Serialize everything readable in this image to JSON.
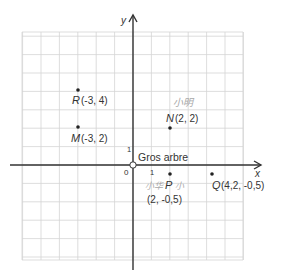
{
  "header": {
    "cut_off_text": ""
  },
  "diagram": {
    "type": "coordinate-plane",
    "origin_px": [
      133,
      165
    ],
    "unit_px": 18.4,
    "grid": {
      "x_min_px": 22,
      "x_max_px": 243,
      "y_min_px": 32,
      "y_max_px": 260,
      "color": "#d4d4d4"
    },
    "axes": {
      "x_label": "x",
      "y_label": "y",
      "origin_label": "0",
      "x_tick_label": "1",
      "y_tick_label": "1",
      "color": "#333333"
    },
    "origin_marker": {
      "label": "Gros arbre"
    },
    "points": [
      {
        "name": "R",
        "coords_label": "(-3, 4)",
        "x": -3,
        "y": 4
      },
      {
        "name": "M",
        "coords_label": "(-3, 2)",
        "x": -3,
        "y": 2
      },
      {
        "name": "N",
        "coords_label": "(2, 2)",
        "x": 2,
        "y": 2
      },
      {
        "name": "P",
        "coords_label": "(2, -0,5)",
        "x": 2,
        "y": -0.5
      },
      {
        "name": "Q",
        "coords_label": "(4,2, -0,5)",
        "x": 4.2,
        "y": -0.5
      }
    ],
    "annotations": [
      {
        "id": "handwriting-near-N",
        "text": "小明",
        "color": "#9a9a9a"
      },
      {
        "id": "handwriting-left-of-P",
        "text": "小华",
        "color": "#9a9a9a"
      },
      {
        "id": "handwriting-right-of-P",
        "text": "小",
        "color": "#9a9a9a"
      }
    ]
  }
}
